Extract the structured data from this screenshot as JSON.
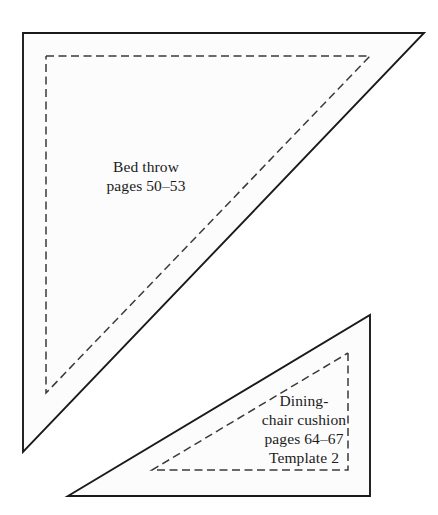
{
  "page": {
    "background_color": "#ffffff",
    "width": 438,
    "height": 515
  },
  "style": {
    "solid_line_color": "#1a1a1a",
    "dashed_line_color": "#3a3a3a",
    "fill_color": "#fcfcfc",
    "text_color": "#1b1b1b"
  },
  "shapes": {
    "large_triangle": {
      "name": "bed-throw-template",
      "outline_points": "23,33 424,33 23,452",
      "cut_line_points": "46,56 370,56 46,393",
      "line_style_outline": "solid",
      "line_style_inner": "dashed"
    },
    "small_triangle": {
      "name": "dining-chair-cushion-template",
      "outline_points": "370,315 370,496 68,496",
      "cut_line_points": "348,353 348,470 152,470",
      "line_style_outline": "solid",
      "line_style_inner": "dashed"
    }
  },
  "labels": {
    "bed_throw": {
      "lines": [
        "Bed throw",
        "pages 50–53"
      ],
      "line1": "Bed throw",
      "line2": "pages 50–53"
    },
    "dining_chair": {
      "lines": [
        "Dining-",
        "chair cushion",
        "pages 64–67",
        "Template 2"
      ],
      "line1": "Dining-",
      "line2": "chair cushion",
      "line3": "pages 64–67",
      "line4": "Template 2"
    }
  }
}
